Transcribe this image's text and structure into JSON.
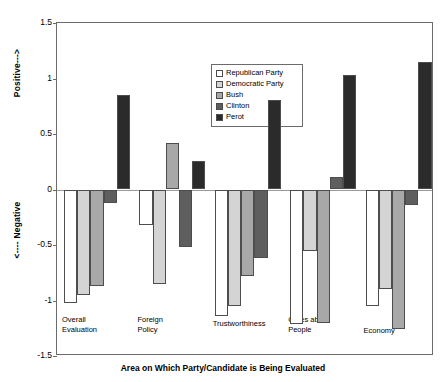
{
  "chart_data": {
    "type": "bar",
    "title": "",
    "xlabel": "Area on Which Party/Candidate is Being Evaluated",
    "ylabel_positive": "Positive--->",
    "ylabel_negative": "<---- Negative",
    "ylim": [
      -1.5,
      1.5
    ],
    "yticks": [
      1.5,
      1,
      0.5,
      0,
      -0.5,
      -1,
      -1.5
    ],
    "ytick_labels": [
      "1.5",
      "1",
      "0.5",
      "0",
      "-0.5",
      "-1",
      "-1.5"
    ],
    "grid": false,
    "legend_position": "upper-center",
    "categories": [
      "Overall\nEvaluation",
      "Foreign\nPolicy",
      "Trustworthiness",
      "Cares about\nPeople",
      "Economy"
    ],
    "series": [
      {
        "name": "Republican Party",
        "color": "#ffffff",
        "values": [
          -1.02,
          -0.32,
          -1.14,
          -1.21,
          -1.05
        ]
      },
      {
        "name": "Democratic Party",
        "color": "#d4d4d4",
        "values": [
          -0.95,
          -0.85,
          -1.05,
          -0.55,
          -0.9
        ]
      },
      {
        "name": "Bush",
        "color": "#a8a8a8",
        "values": [
          -0.87,
          0.42,
          -0.78,
          -1.2,
          -1.26
        ]
      },
      {
        "name": "Clinton",
        "color": "#5e5e5e",
        "values": [
          -0.12,
          -0.52,
          -0.62,
          0.11,
          -0.14
        ]
      },
      {
        "name": "Perot",
        "color": "#2b2b2b",
        "values": [
          0.85,
          0.26,
          0.81,
          1.03,
          1.15
        ]
      }
    ]
  },
  "axis": {
    "frame_color": "#6b6b6b",
    "zero_line_color": "#9a9a9a"
  }
}
